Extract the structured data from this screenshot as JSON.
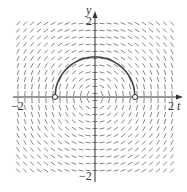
{
  "chart_data": {
    "type": "slope-field",
    "equation": "dy/dt = -t/y",
    "xlabel": "t",
    "ylabel": "y",
    "xlim": [
      -2,
      2
    ],
    "ylim": [
      -2,
      2
    ],
    "tick_labels": {
      "x": [
        "-2",
        "2"
      ],
      "y": [
        "2",
        "-2"
      ]
    },
    "solution_curve": {
      "description": "upper semicircle y = sqrt(1 - t^2)",
      "t_range": [
        -1,
        1
      ],
      "open_endpoints": [
        [
          -1,
          0
        ],
        [
          1,
          0
        ]
      ],
      "max_point": [
        0,
        1
      ]
    },
    "grid": false
  },
  "labels": {
    "x_axis": "t",
    "y_axis": "y",
    "x_min": "−2",
    "x_max": "2",
    "y_max": "2",
    "y_min": "−2"
  }
}
